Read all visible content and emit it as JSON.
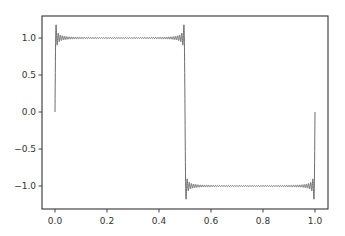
{
  "chart_data": {
    "type": "line",
    "title": "",
    "xlabel": "",
    "ylabel": "",
    "xlim": [
      -0.05,
      1.05
    ],
    "ylim": [
      -1.3,
      1.25
    ],
    "grid": false,
    "legend": null,
    "xticks": [
      0.0,
      0.2,
      0.4,
      0.6,
      0.8,
      1.0
    ],
    "xtick_labels": [
      "0.0",
      "0.2",
      "0.4",
      "0.6",
      "0.8",
      "1.0"
    ],
    "yticks": [
      1.0,
      0.5,
      0.0,
      -0.5,
      -1.0
    ],
    "ytick_labels": [
      "1.0",
      "0.5",
      "0.0",
      "−0.5",
      "−1.0"
    ],
    "series": [
      {
        "name": "Fourier partial sum of square wave",
        "color": "#6e6e6e",
        "description": "Square wave (+1 on 0-0.5, -1 on 0.5-1) approximated by truncated Fourier series showing Gibbs overshoot ~1.18",
        "n_harmonics": 60,
        "x": [
          0.0,
          0.005,
          0.01,
          0.05,
          0.1,
          0.2,
          0.3,
          0.4,
          0.45,
          0.49,
          0.495,
          0.5,
          0.505,
          0.51,
          0.55,
          0.6,
          0.7,
          0.8,
          0.9,
          0.95,
          0.99,
          0.995,
          1.0
        ],
        "y": [
          0.0,
          1.18,
          0.93,
          1.0,
          1.0,
          1.0,
          1.0,
          1.0,
          1.0,
          0.93,
          1.18,
          0.0,
          -1.18,
          -0.93,
          -1.0,
          -1.0,
          -1.0,
          -1.0,
          -1.0,
          -1.0,
          -0.93,
          -1.18,
          0.0
        ]
      }
    ]
  },
  "plot_area": {
    "left": 42,
    "top": 16,
    "right": 328,
    "bottom": 209
  },
  "colors": {
    "axis": "#333333",
    "line": "#6e6e6e",
    "background": "#ffffff"
  }
}
